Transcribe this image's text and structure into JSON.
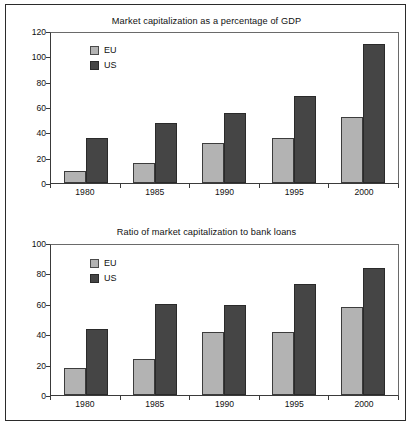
{
  "figure": {
    "frame_color": "#2b2b2b",
    "background": "#ffffff"
  },
  "series_colors": {
    "eu": "#b3b3b3",
    "us": "#454545"
  },
  "legend": {
    "eu_label": "EU",
    "us_label": "US"
  },
  "chart_data": [
    {
      "type": "bar",
      "title": "Market capitalization as a percentage of GDP",
      "xlabel": "",
      "ylabel": "",
      "categories": [
        "1980",
        "1985",
        "1990",
        "1995",
        "2000"
      ],
      "series": [
        {
          "name": "EU",
          "values": [
            10,
            16,
            32,
            36,
            53
          ]
        },
        {
          "name": "US",
          "values": [
            36,
            48,
            56,
            70,
            111
          ]
        }
      ],
      "ylim": [
        0,
        120
      ],
      "yticks": [
        0,
        20,
        40,
        60,
        80,
        100,
        120
      ],
      "ytick_labels": [
        "0",
        "20",
        "40",
        "60",
        "80",
        "100",
        "120"
      ],
      "grid": false,
      "legend_position": "upper-left-inside"
    },
    {
      "type": "bar",
      "title": "Ratio of market capitalization to bank loans",
      "xlabel": "",
      "ylabel": "",
      "categories": [
        "1980",
        "1985",
        "1990",
        "1995",
        "2000"
      ],
      "series": [
        {
          "name": "EU",
          "values": [
            18,
            24,
            42,
            42,
            59
          ]
        },
        {
          "name": "US",
          "values": [
            44,
            61,
            60,
            74,
            85
          ]
        }
      ],
      "ylim": [
        0,
        100
      ],
      "yticks": [
        0,
        20,
        40,
        60,
        80,
        100
      ],
      "ytick_labels": [
        "0",
        "20",
        "40",
        "60",
        "80",
        "100"
      ],
      "grid": false,
      "legend_position": "upper-left-inside"
    }
  ]
}
